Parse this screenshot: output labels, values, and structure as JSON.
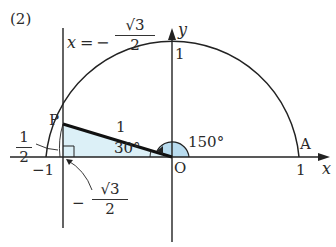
{
  "problem_label": "(2)",
  "line_equation": {
    "lhs": "x",
    "eq": "=",
    "sign": "−",
    "numerator": "√3",
    "denominator": "2"
  },
  "axes": {
    "x_label": "x",
    "y_label": "y",
    "origin_label": "O"
  },
  "ticks": {
    "y_one": "1",
    "x_one": "1",
    "x_neg_one": "−1"
  },
  "points": {
    "P": "P",
    "A": "A"
  },
  "segment_label": "1",
  "angles": {
    "inner": "30°",
    "outer": "150°"
  },
  "height_label": {
    "numerator": "1",
    "denominator": "2"
  },
  "foot_label": {
    "sign": "−",
    "numerator": "√3",
    "denominator": "2"
  },
  "colors": {
    "fill": "#d8eef6",
    "line": "#222222"
  }
}
